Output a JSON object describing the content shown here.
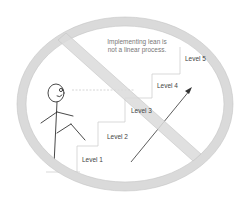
{
  "caption": {
    "line1": "Implementing lean is",
    "line2": "not a linear process."
  },
  "levels": [
    {
      "label": "Level 1"
    },
    {
      "label": "Level 2"
    },
    {
      "label": "Level 3"
    },
    {
      "label": "Level 4"
    },
    {
      "label": "Level 5"
    }
  ],
  "colors": {
    "prohibition_sign": "#d9d9d9",
    "prohibition_outline": "#bfbfbf",
    "stairs": "#d0d0d0",
    "stick_figure": "#333333",
    "arrow": "#333333"
  },
  "icons": {
    "prohibition": "no-symbol",
    "figure": "stick-figure",
    "arrow": "up-right-arrow"
  }
}
